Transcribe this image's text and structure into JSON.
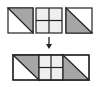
{
  "diagram": {
    "colors": {
      "background": "#ffffff",
      "stroke": "#222222",
      "triangle_fill": "#a6a6a6",
      "fourpatch_fill": "#efefef",
      "white_fill": "#ffffff"
    },
    "top_row": [
      {
        "id": "hst-left",
        "type": "half-square-triangle",
        "x": 8,
        "y": 8,
        "size": 25,
        "shaded": "upper-right"
      },
      {
        "id": "four-patch",
        "type": "four-patch",
        "x": 36,
        "y": 8,
        "size": 26
      },
      {
        "id": "hst-right",
        "type": "half-square-triangle",
        "x": 66,
        "y": 8,
        "size": 26,
        "shaded": "lower-left"
      }
    ],
    "arrow": {
      "direction": "down",
      "x": 49,
      "y1": 37,
      "y2": 49
    },
    "bottom_row": {
      "x": 13,
      "y": 55,
      "width": 76,
      "height": 25,
      "segments": [
        {
          "id": "hst-left-joined",
          "type": "half-square-triangle",
          "x": 13,
          "w": 26,
          "shaded": "upper-right"
        },
        {
          "id": "four-patch-joined",
          "type": "four-patch",
          "x": 39,
          "w": 24
        },
        {
          "id": "hst-right-joined",
          "type": "half-square-triangle",
          "x": 63,
          "w": 26,
          "shaded": "lower-left"
        }
      ]
    }
  }
}
